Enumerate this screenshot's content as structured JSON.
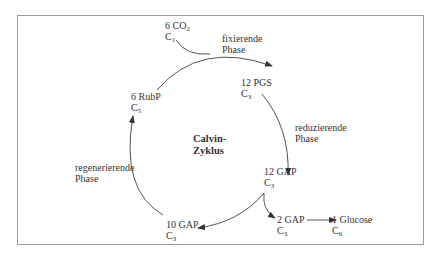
{
  "diagram": {
    "center_label": {
      "line1": "Calvin-",
      "line2": "Zyklus"
    },
    "nodes": [
      {
        "id": "co2",
        "amount": "6 CO",
        "sub": "2",
        "carbon": "C",
        "carbon_sub": "1"
      },
      {
        "id": "pgs",
        "amount": "12 PGS",
        "carbon": "C",
        "carbon_sub": "3"
      },
      {
        "id": "gap12",
        "amount": "12 GAP",
        "carbon": "C",
        "carbon_sub": "3"
      },
      {
        "id": "gap2",
        "amount": "2 GAP",
        "carbon": "C",
        "carbon_sub": "3"
      },
      {
        "id": "glucose",
        "amount": "1 Glucose",
        "carbon": "C",
        "carbon_sub": "6"
      },
      {
        "id": "gap10",
        "amount": "10 GAP",
        "carbon": "C",
        "carbon_sub": "3"
      },
      {
        "id": "rubp",
        "amount": "6 RubP",
        "carbon": "C",
        "carbon_sub": "5"
      }
    ],
    "phases": [
      {
        "id": "fix",
        "line1": "fixierende",
        "line2": "Phase"
      },
      {
        "id": "red",
        "line1": "reduzierende",
        "line2": "Phase"
      },
      {
        "id": "reg",
        "line1": "regenerierende",
        "line2": "Phase"
      }
    ],
    "colors": {
      "stroke": "#555555",
      "frame": "#9a9a9a",
      "text": "#333333"
    }
  }
}
